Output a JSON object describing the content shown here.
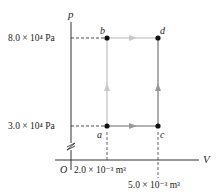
{
  "diagram": {
    "type": "pV-diagram",
    "axes": {
      "y_label": "p",
      "x_label": "V",
      "origin_label": "O"
    },
    "pressure_ticks": [
      {
        "label": "8.0 × 10⁴ Pa",
        "value": 80000
      },
      {
        "label": "3.0 × 10⁴ Pa",
        "value": 30000
      }
    ],
    "volume_ticks": [
      {
        "label": "2.0 × 10⁻³ m³",
        "value": 0.002
      },
      {
        "label": "5.0 × 10⁻³ m³",
        "value": 0.005
      }
    ],
    "points": [
      {
        "name": "a",
        "V": 0.002,
        "p": 30000
      },
      {
        "name": "b",
        "V": 0.002,
        "p": 80000
      },
      {
        "name": "c",
        "V": 0.005,
        "p": 30000
      },
      {
        "name": "d",
        "V": 0.005,
        "p": 80000
      }
    ],
    "paths": [
      {
        "from": "a",
        "to": "b",
        "direction": "up"
      },
      {
        "from": "b",
        "to": "d",
        "direction": "right"
      },
      {
        "from": "a",
        "to": "c",
        "direction": "right"
      },
      {
        "from": "c",
        "to": "d",
        "direction": "up"
      }
    ],
    "colors": {
      "axis": "#333333",
      "path_light": "#c8c8c8",
      "path_dark": "#999999",
      "point": "#111111"
    }
  }
}
